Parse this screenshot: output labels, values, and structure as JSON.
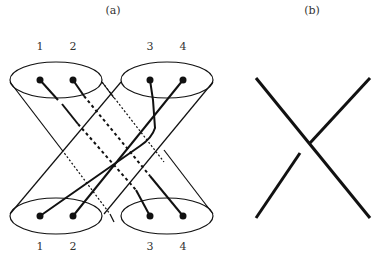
{
  "panels": {
    "a": {
      "label": "(a)"
    },
    "b": {
      "label": "(b)"
    }
  },
  "top_labels": [
    "1",
    "2",
    "3",
    "4"
  ],
  "bottom_labels": [
    "1",
    "2",
    "3",
    "4"
  ]
}
